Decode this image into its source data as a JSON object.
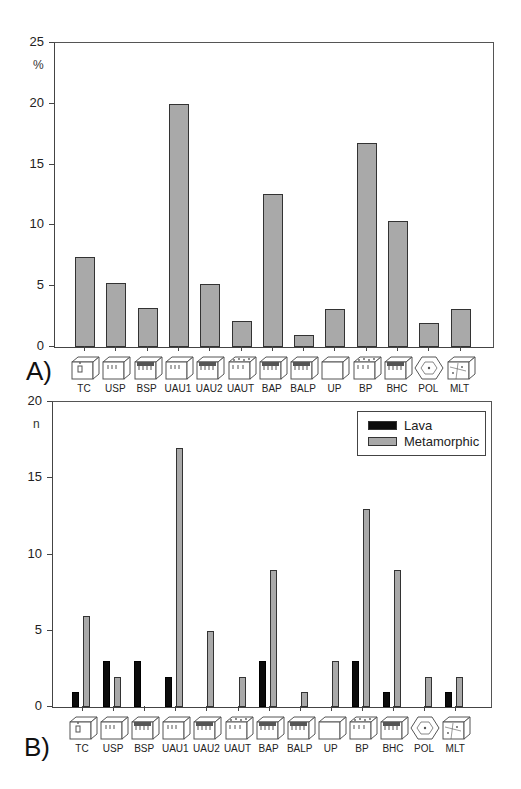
{
  "chart_data": [
    {
      "id": "A",
      "type": "bar",
      "panel_label": "A)",
      "title": "",
      "xlabel": "",
      "ylabel": "%",
      "ylim": [
        0,
        25
      ],
      "yticks": [
        0,
        5,
        10,
        15,
        20,
        25
      ],
      "grid": false,
      "categories": [
        "TC",
        "USP",
        "BSP",
        "UAU1",
        "UAU2",
        "UAUT",
        "BAP",
        "BALP",
        "UP",
        "BP",
        "BHC",
        "POL",
        "MLT"
      ],
      "values": [
        7.4,
        5.3,
        3.2,
        20.0,
        5.2,
        2.1,
        12.6,
        1.0,
        3.1,
        16.8,
        10.4,
        2.0,
        3.1
      ],
      "bar_color": "#a9a9a9"
    },
    {
      "id": "B",
      "type": "bar",
      "panel_label": "B)",
      "title": "",
      "xlabel": "",
      "ylabel": "n",
      "ylim": [
        0,
        20
      ],
      "yticks": [
        0,
        5,
        10,
        15,
        20
      ],
      "grid": false,
      "legend_position": "upper right",
      "categories": [
        "TC",
        "USP",
        "BSP",
        "UAU1",
        "UAU2",
        "UAUT",
        "BAP",
        "BALP",
        "UP",
        "BP",
        "BHC",
        "POL",
        "MLT"
      ],
      "series": [
        {
          "name": "Lava",
          "color": "#0c0c0c",
          "values": [
            1,
            3,
            3,
            2,
            0,
            0,
            3,
            0,
            0,
            3,
            1,
            0,
            1
          ]
        },
        {
          "name": "Metamorphic",
          "color": "#a9a9a9",
          "values": [
            6,
            2,
            0,
            17,
            5,
            2,
            9,
            1,
            3,
            13,
            9,
            2,
            2
          ]
        }
      ]
    }
  ],
  "legend": {
    "lava": "Lava",
    "metamorphic": "Metamorphic"
  },
  "icons": [
    "TC-block-icon",
    "USP-block-icon",
    "BSP-block-icon",
    "UAU1-block-icon",
    "UAU2-block-icon",
    "UAUT-block-icon",
    "BAP-block-icon",
    "BALP-block-icon",
    "UP-block-icon",
    "BP-block-icon",
    "BHC-block-icon",
    "POL-polygon-icon",
    "MLT-block-icon"
  ]
}
